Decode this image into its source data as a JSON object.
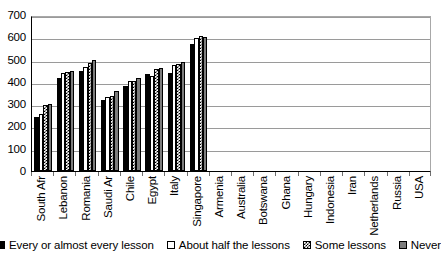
{
  "chart_data": {
    "type": "bar",
    "title": "",
    "subtitle": "",
    "xlabel": "",
    "ylabel": "",
    "ylim": [
      0,
      700
    ],
    "ytick_step": 100,
    "yticks": [
      0,
      100,
      200,
      300,
      400,
      500,
      600,
      700
    ],
    "ytick_labels": [
      "0",
      "100",
      "200",
      "300",
      "400",
      "500",
      "600",
      "700"
    ],
    "grid": true,
    "grid_axis": "y",
    "legend_position": "bottom",
    "categories": [
      "South Afr",
      "Lebanon",
      "Romania",
      "Saudi Ar",
      "Chile",
      "Egypt",
      "Italy",
      "Singapore",
      "Armenia",
      "Australia",
      "Botswana",
      "Ghana",
      "Hungary",
      "Indonesia",
      "Iran",
      "Netherlands",
      "Russia",
      "USA"
    ],
    "series": [
      {
        "name": "Every or almost every lesson",
        "color": "#000000",
        "pattern": "solid-black",
        "values": [
          243,
          417,
          447,
          318,
          381,
          434,
          439,
          572,
          null,
          null,
          null,
          null,
          null,
          null,
          null,
          null,
          null,
          null
        ]
      },
      {
        "name": "About half the lessons",
        "color": "#ffffff",
        "pattern": "white-outline",
        "values": [
          256,
          440,
          466,
          334,
          406,
          428,
          477,
          597,
          null,
          null,
          null,
          null,
          null,
          null,
          null,
          null,
          null,
          null
        ]
      },
      {
        "name": "Some lessons",
        "color": "#ffffff",
        "pattern": "checkerboard",
        "values": [
          294,
          443,
          486,
          337,
          405,
          460,
          479,
          604,
          null,
          null,
          null,
          null,
          null,
          null,
          null,
          null,
          null,
          null
        ]
      },
      {
        "name": "Never",
        "color": "#7d7d7d",
        "pattern": "solid-gray",
        "values": [
          301,
          448,
          496,
          357,
          419,
          461,
          490,
          601,
          null,
          null,
          null,
          null,
          null,
          null,
          null,
          null,
          null,
          null
        ]
      }
    ]
  },
  "legend": {
    "items": [
      {
        "label": "Every or almost every lesson",
        "swatch": "solid-black"
      },
      {
        "label": "About half the lessons",
        "swatch": "white-outline"
      },
      {
        "label": "Some lessons",
        "swatch": "checkerboard"
      },
      {
        "label": "Never",
        "swatch": "solid-gray"
      }
    ]
  }
}
